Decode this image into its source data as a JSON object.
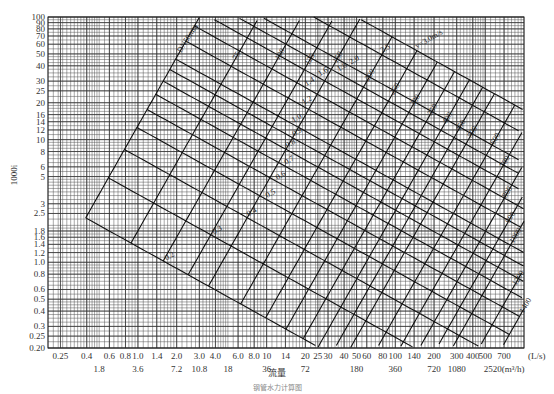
{
  "chart_data": {
    "type": "nomogram",
    "title": "",
    "xlabel": "流量",
    "ylabel": "1000i",
    "x_scale": "log",
    "y_scale": "log",
    "xlim": [
      0.2,
      1000
    ],
    "ylim": [
      0.2,
      100
    ],
    "grid": true,
    "x_ticks_ls": [
      "0.25",
      "0.4",
      "0.6",
      "0.8",
      "1.0",
      "1.4",
      "2.0",
      "3.0",
      "4.0",
      "6.0",
      "8.0",
      "10",
      "14",
      "20",
      "25",
      "30",
      "40",
      "50",
      "60",
      "80",
      "100",
      "140",
      "200",
      "300",
      "400",
      "500",
      "700"
    ],
    "x_tick_values_ls": [
      0.25,
      0.4,
      0.6,
      0.8,
      1.0,
      1.4,
      2.0,
      3.0,
      4.0,
      6.0,
      8.0,
      10,
      14,
      20,
      25,
      30,
      40,
      50,
      60,
      80,
      100,
      140,
      200,
      300,
      400,
      500,
      700
    ],
    "x_unit_ls": "(L/s)",
    "x_ticks_m3h": [
      {
        "label": "1.8",
        "at_ls": 0.5
      },
      {
        "label": "3.6",
        "at_ls": 1.0
      },
      {
        "label": "7.2",
        "at_ls": 2.0
      },
      {
        "label": "10.8",
        "at_ls": 3.0
      },
      {
        "label": "18",
        "at_ls": 5.0
      },
      {
        "label": "36",
        "at_ls": 10
      },
      {
        "label": "72",
        "at_ls": 20
      },
      {
        "label": "180",
        "at_ls": 50
      },
      {
        "label": "360",
        "at_ls": 100
      },
      {
        "label": "720",
        "at_ls": 200
      },
      {
        "label": "1080",
        "at_ls": 300
      },
      {
        "label": "2520(m³/h)",
        "at_ls": 700
      }
    ],
    "y_ticks": [
      "0.20",
      "0.25",
      "0.3",
      "0.4",
      "0.5",
      "0.6",
      "0.8",
      "1.0",
      "1.2",
      "1.4",
      "1.6",
      "1.8",
      "2.5",
      "3",
      "5",
      "6",
      "8",
      "10",
      "12",
      "14",
      "16",
      "20",
      "25",
      "30",
      "40",
      "50",
      "60",
      "70",
      "80",
      "90",
      "100"
    ],
    "y_tick_values": [
      0.2,
      0.25,
      0.3,
      0.4,
      0.5,
      0.6,
      0.8,
      1.0,
      1.2,
      1.4,
      1.6,
      1.8,
      2.5,
      3,
      5,
      6,
      8,
      10,
      12,
      14,
      16,
      20,
      25,
      30,
      40,
      50,
      60,
      70,
      80,
      90,
      100
    ],
    "diameter_lines": {
      "unit": "mm",
      "label_prefix": "DN",
      "values": [
        50,
        75,
        100,
        125,
        150,
        200,
        250,
        300,
        350,
        400,
        450,
        500,
        600,
        700,
        800,
        900,
        1000,
        1200,
        1400
      ],
      "labels": [
        "DN50mm",
        "75",
        "100",
        "125",
        "150",
        "200",
        "250",
        "300",
        "350",
        "400",
        "450",
        "500",
        "600",
        "700",
        "800",
        "900",
        "1000",
        "1200",
        "1400"
      ]
    },
    "velocity_lines": {
      "unit": "m/s",
      "values": [
        3.0,
        2.5,
        2.0,
        1.8,
        1.6,
        1.4,
        1.2,
        1.0,
        0.9,
        0.8,
        0.7,
        0.6,
        0.5,
        0.4,
        0.3,
        0.2
      ],
      "labels": [
        "v=3.0m/s",
        "2.5",
        "2.0",
        "1.8",
        "1.6",
        "1.4",
        "1.2",
        "1.0",
        "0.9",
        "0.8",
        "0.7",
        "0.6",
        "0.5",
        "0.4",
        "0.3",
        "0.2"
      ]
    },
    "colors": {
      "grid": "#555555",
      "lines": "#111111",
      "background": "#ffffff"
    }
  },
  "axis": {
    "ylabel": "1000i",
    "xlabel": "流量",
    "x_unit": "(L/s)"
  },
  "caption": "钢管水力计算图"
}
